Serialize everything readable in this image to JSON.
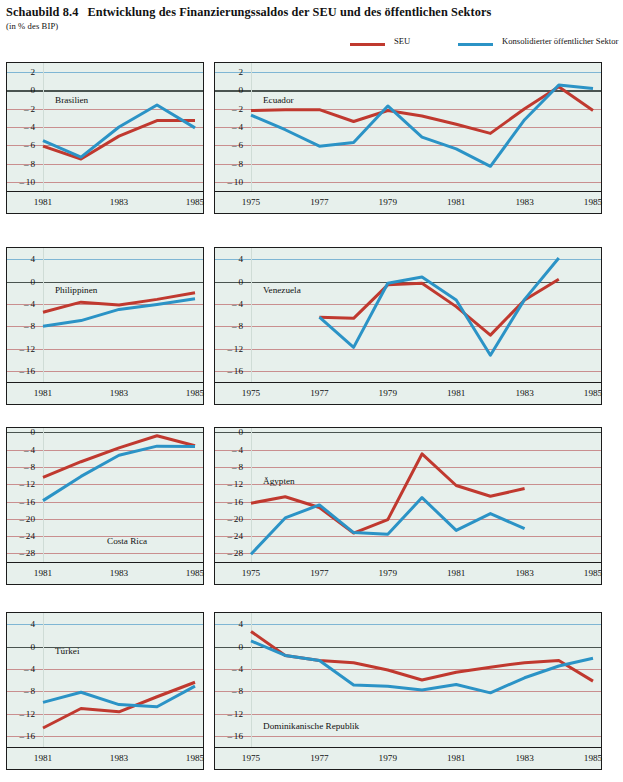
{
  "header": {
    "figure_number": "Schaubild 8.4",
    "title": "Entwicklung des Finanzierungssaldos der SEU und des öffentlichen Sektors",
    "subtitle": "(in % des BIP)",
    "legend": [
      {
        "key": "seu",
        "label": "SEU",
        "color": "#c0392f"
      },
      {
        "key": "kons",
        "label": "Konsolidierter öffentlicher Sektor",
        "color": "#2b93c6"
      }
    ]
  },
  "colors": {
    "seu": "#c0392f",
    "konsolidiert": "#2b93c6",
    "panel_background": "#e7f0ec",
    "gridline_red": "#c98f8f",
    "gridline_blue": "#7fb6d4",
    "axis": "#1c1c1c"
  },
  "chart_data": [
    {
      "id": "brasilien",
      "type": "line",
      "title": "Brasilien",
      "xlabel": "",
      "ylabel": "",
      "xlim": [
        1981,
        1985
      ],
      "ylim": [
        -11,
        3
      ],
      "yticks": [
        2,
        0,
        -2,
        -4,
        -6,
        -8,
        -10
      ],
      "xticks": [
        1981,
        1983,
        1985
      ],
      "grid": true,
      "x": [
        1981,
        1982,
        1983,
        1984,
        1985
      ],
      "series": [
        {
          "name": "SEU",
          "color": "#c0392f",
          "values": [
            -6.1,
            -7.5,
            -5.0,
            -3.3,
            -3.3
          ]
        },
        {
          "name": "Konsolidierter öffentlicher Sektor",
          "color": "#2b93c6",
          "values": [
            -5.5,
            -7.3,
            -4.0,
            -1.6,
            -4.1
          ]
        }
      ]
    },
    {
      "id": "ecuador",
      "type": "line",
      "title": "Ecuador",
      "xlabel": "",
      "ylabel": "",
      "xlim": [
        1975,
        1985
      ],
      "ylim": [
        -11,
        3
      ],
      "yticks": [
        2,
        0,
        -2,
        -4,
        -6,
        -8,
        -10
      ],
      "xticks": [
        1975,
        1977,
        1979,
        1981,
        1983,
        1985
      ],
      "grid": true,
      "x": [
        1975,
        1976,
        1977,
        1978,
        1979,
        1980,
        1981,
        1982,
        1983,
        1984,
        1985
      ],
      "series": [
        {
          "name": "SEU",
          "color": "#c0392f",
          "values": [
            -2.2,
            -2.1,
            -2.1,
            -3.4,
            -2.2,
            -2.8,
            -3.7,
            -4.7,
            -2.0,
            0.4,
            -2.2
          ]
        },
        {
          "name": "Konsolidierter öffentlicher Sektor",
          "color": "#2b93c6",
          "values": [
            -2.7,
            -4.3,
            -6.1,
            -5.7,
            -1.7,
            -5.1,
            -6.4,
            -8.3,
            -3.2,
            0.6,
            0.2
          ]
        }
      ]
    },
    {
      "id": "philippinen",
      "type": "line",
      "title": "Philippinen",
      "xlabel": "",
      "ylabel": "",
      "xlim": [
        1981,
        1985
      ],
      "ylim": [
        -18,
        6
      ],
      "yticks": [
        4,
        0,
        -4,
        -8,
        -12,
        -16
      ],
      "xticks": [
        1981,
        1983,
        1985
      ],
      "grid": true,
      "x": [
        1981,
        1982,
        1983,
        1984,
        1985
      ],
      "series": [
        {
          "name": "SEU",
          "color": "#c0392f",
          "values": [
            -5.5,
            -3.7,
            -4.2,
            -3.2,
            -2.0
          ]
        },
        {
          "name": "Konsolidierter öffentlicher Sektor",
          "color": "#2b93c6",
          "values": [
            -8.0,
            -7.0,
            -5.0,
            -4.1,
            -3.1
          ]
        }
      ]
    },
    {
      "id": "venezuela",
      "type": "line",
      "title": "Venezuela",
      "xlabel": "",
      "ylabel": "",
      "xlim": [
        1975,
        1985
      ],
      "ylim": [
        -18,
        6
      ],
      "yticks": [
        4,
        0,
        -4,
        -8,
        -12,
        -16
      ],
      "xticks": [
        1975,
        1977,
        1979,
        1981,
        1983,
        1985
      ],
      "grid": true,
      "x": [
        1977,
        1978,
        1979,
        1980,
        1981,
        1982,
        1983,
        1984
      ],
      "series": [
        {
          "name": "SEU",
          "color": "#c0392f",
          "values": [
            -6.4,
            -6.6,
            -0.6,
            -0.3,
            -4.5,
            -9.6,
            -3.3,
            0.4
          ]
        },
        {
          "name": "Konsolidierter öffentlicher Sektor",
          "color": "#2b93c6",
          "values": [
            -6.4,
            -11.8,
            -0.3,
            0.8,
            -3.3,
            -13.2,
            -3.2,
            4.2
          ]
        }
      ]
    },
    {
      "id": "costa-rica",
      "type": "line",
      "title": "Costa Rica",
      "xlabel": "",
      "ylabel": "",
      "xlim": [
        1981,
        1985
      ],
      "ylim": [
        -30,
        1
      ],
      "yticks": [
        0,
        -4,
        -8,
        -12,
        -16,
        -20,
        -24,
        -28
      ],
      "xticks": [
        1981,
        1983,
        1985
      ],
      "grid": true,
      "x": [
        1981,
        1982,
        1983,
        1984,
        1985
      ],
      "series": [
        {
          "name": "SEU",
          "color": "#c0392f",
          "values": [
            -10.4,
            -6.8,
            -3.6,
            -0.8,
            -3.1
          ]
        },
        {
          "name": "Konsolidierter öffentlicher Sektor",
          "color": "#2b93c6",
          "values": [
            -15.8,
            -10.2,
            -5.3,
            -3.2,
            -3.3
          ]
        }
      ]
    },
    {
      "id": "aegypten",
      "type": "line",
      "title": "Ägypten",
      "xlabel": "",
      "ylabel": "",
      "xlim": [
        1975,
        1985
      ],
      "ylim": [
        -30,
        1
      ],
      "yticks": [
        0,
        -4,
        -8,
        -12,
        -16,
        -20,
        -24,
        -28
      ],
      "xticks": [
        1975,
        1977,
        1979,
        1981,
        1983,
        1985
      ],
      "grid": true,
      "x": [
        1975,
        1976,
        1977,
        1978,
        1979,
        1980,
        1981,
        1982,
        1983
      ],
      "series": [
        {
          "name": "SEU",
          "color": "#c0392f",
          "values": [
            -16.4,
            -14.9,
            -17.4,
            -23.3,
            -20.2,
            -5.0,
            -12.3,
            -14.8,
            -13.0
          ]
        },
        {
          "name": "Konsolidierter öffentlicher Sektor",
          "color": "#2b93c6",
          "values": [
            -28.2,
            -19.8,
            -16.8,
            -23.2,
            -23.6,
            -15.1,
            -22.7,
            -18.8,
            -22.3
          ]
        }
      ]
    },
    {
      "id": "tuerkei",
      "type": "line",
      "title": "Türkei",
      "xlabel": "",
      "ylabel": "",
      "xlim": [
        1981,
        1985
      ],
      "ylim": [
        -18,
        6
      ],
      "yticks": [
        4,
        0,
        -4,
        -8,
        -12,
        -16
      ],
      "xticks": [
        1981,
        1983,
        1985
      ],
      "grid": true,
      "x": [
        1981,
        1982,
        1983,
        1984,
        1985
      ],
      "series": [
        {
          "name": "SEU",
          "color": "#c0392f",
          "values": [
            -14.6,
            -11.1,
            -11.7,
            -9.0,
            -6.4
          ]
        },
        {
          "name": "Konsolidierter öffentlicher Sektor",
          "color": "#2b93c6",
          "values": [
            -10.0,
            -8.2,
            -10.4,
            -10.8,
            -7.1
          ]
        }
      ]
    },
    {
      "id": "dominikanische-republik",
      "type": "line",
      "title": "Dominikanische Republik",
      "xlabel": "",
      "ylabel": "",
      "xlim": [
        1975,
        1985
      ],
      "ylim": [
        -18,
        6
      ],
      "yticks": [
        4,
        0,
        -4,
        -8,
        -12,
        -16
      ],
      "xticks": [
        1975,
        1977,
        1979,
        1981,
        1983,
        1985
      ],
      "grid": true,
      "x": [
        1975,
        1976,
        1977,
        1978,
        1979,
        1980,
        1981,
        1982,
        1983,
        1984,
        1985
      ],
      "series": [
        {
          "name": "SEU",
          "color": "#c0392f",
          "values": [
            2.7,
            -1.6,
            -2.5,
            -2.9,
            -4.2,
            -6.0,
            -4.6,
            -3.7,
            -2.9,
            -2.5,
            -6.2
          ]
        },
        {
          "name": "Konsolidierter öffentlicher Sektor",
          "color": "#2b93c6",
          "values": [
            1.0,
            -1.6,
            -2.5,
            -6.9,
            -7.1,
            -7.8,
            -6.8,
            -8.3,
            -5.6,
            -3.5,
            -2.1
          ]
        }
      ]
    }
  ]
}
